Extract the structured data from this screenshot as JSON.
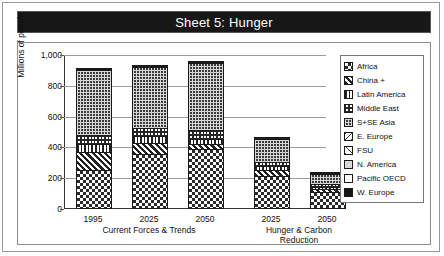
{
  "title": "Sheet 5: Hunger",
  "chart_data": {
    "type": "bar",
    "subtype": "stacked",
    "title": "Sheet 5: Hunger",
    "xlabel": "",
    "ylabel": "Millions of people",
    "ylim": [
      0,
      1000
    ],
    "yticks": [
      0,
      200,
      400,
      600,
      800,
      1000
    ],
    "ytick_labels": [
      "0",
      "200",
      "400",
      "600",
      "800",
      "1,000"
    ],
    "grid": true,
    "legend_position": "right",
    "categories": [
      "1995",
      "2025",
      "2050",
      "2025",
      "2050"
    ],
    "groups": [
      {
        "label": "Current Forces & Trends",
        "categories": [
          "1995",
          "2025",
          "2050"
        ]
      },
      {
        "label": "Hunger & Carbon Reduction",
        "categories": [
          "2025",
          "2050"
        ]
      }
    ],
    "series": [
      {
        "name": "Africa",
        "pattern": "checkerboard",
        "values": [
          240,
          345,
          375,
          200,
          100
        ]
      },
      {
        "name": "China +",
        "pattern": "diagonal-dense",
        "values": [
          115,
          70,
          35,
          40,
          15
        ]
      },
      {
        "name": "Latin America",
        "pattern": "vertical-lines",
        "values": [
          55,
          45,
          35,
          25,
          15
        ]
      },
      {
        "name": "Middle East",
        "pattern": "grid-fine",
        "values": [
          55,
          55,
          55,
          30,
          20
        ]
      },
      {
        "name": "S+SE Asia",
        "pattern": "dark-grid",
        "values": [
          425,
          395,
          435,
          150,
          65
        ]
      },
      {
        "name": "E. Europe",
        "pattern": "diagonal-sparse-bs",
        "values": [
          5,
          5,
          5,
          3,
          2
        ]
      },
      {
        "name": "FSU",
        "pattern": "diagonal-sparse-fs",
        "values": [
          5,
          5,
          5,
          3,
          2
        ]
      },
      {
        "name": "N. America",
        "pattern": "light-gray",
        "values": [
          0,
          0,
          0,
          0,
          0
        ]
      },
      {
        "name": "Pacific OECD",
        "pattern": "white",
        "values": [
          0,
          0,
          0,
          0,
          0
        ]
      },
      {
        "name": "W. Europe",
        "pattern": "solid-black",
        "values": [
          0,
          0,
          0,
          0,
          0
        ]
      }
    ],
    "totals": [
      900,
      920,
      945,
      451,
      219
    ]
  },
  "legend": {
    "items": [
      {
        "label": "Africa",
        "swatch": "p-africa"
      },
      {
        "label": "China +",
        "swatch": "p-china"
      },
      {
        "label": "Latin America",
        "swatch": "p-latin"
      },
      {
        "label": "Middle East",
        "swatch": "p-mideast"
      },
      {
        "label": "S+SE Asia",
        "swatch": "p-ssea"
      },
      {
        "label": "E. Europe",
        "swatch": "p-eeurope"
      },
      {
        "label": "FSU",
        "swatch": "p-fsu"
      },
      {
        "label": "N. America",
        "swatch": "p-namerica"
      },
      {
        "label": "Pacific OECD",
        "swatch": "p-pacoecd"
      },
      {
        "label": "W. Europe",
        "swatch": "p-weurope"
      }
    ]
  }
}
